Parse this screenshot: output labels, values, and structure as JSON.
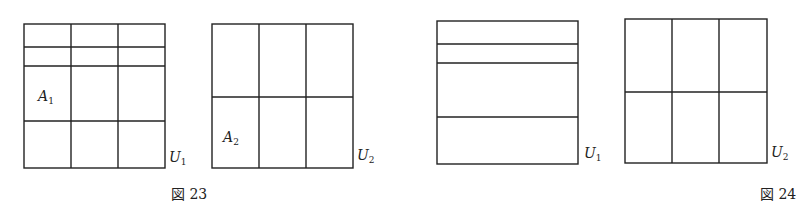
{
  "figures": [
    {
      "caption": "図 23",
      "panels": [
        {
          "id": "U1",
          "label": "U",
          "label_sub": "1",
          "region_label": "A",
          "region_sub": "1",
          "x": 24,
          "y": 24,
          "w": 141,
          "h": 144,
          "h_lines": [
            47,
            66,
            121
          ],
          "v_lines": [
            71,
            118
          ]
        },
        {
          "id": "U2",
          "label": "U",
          "label_sub": "2",
          "region_label": "A",
          "region_sub": "2",
          "x": 212,
          "y": 24,
          "w": 141,
          "h": 144,
          "h_lines": [
            97
          ],
          "v_lines": [
            259,
            306
          ]
        }
      ]
    },
    {
      "caption": "図 24",
      "panels": [
        {
          "id": "U1",
          "label": "U",
          "label_sub": "1",
          "x": 437,
          "y": 21,
          "w": 141,
          "h": 143,
          "h_lines": [
            44,
            63,
            117
          ],
          "v_lines": []
        },
        {
          "id": "U2",
          "label": "U",
          "label_sub": "2",
          "x": 625,
          "y": 19,
          "w": 142,
          "h": 144,
          "h_lines": [
            92
          ],
          "v_lines": [
            672,
            719
          ]
        }
      ]
    }
  ]
}
